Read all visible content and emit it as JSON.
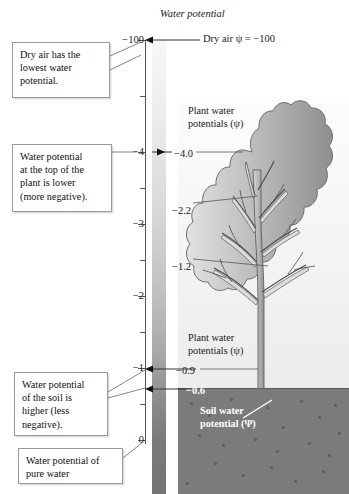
{
  "figure": {
    "title": "Water potential",
    "dry_air_label": "Dry air ψ = −100"
  },
  "axis": {
    "major_ticks": [
      {
        "label": "−100",
        "y": 40
      },
      {
        "label": "−4",
        "y": 152
      },
      {
        "label": "−3",
        "y": 224
      },
      {
        "label": "−2",
        "y": 296
      },
      {
        "label": "−1",
        "y": 368
      },
      {
        "label": "0",
        "y": 440
      }
    ],
    "minor_ticks_y": [
      96,
      188,
      260,
      332,
      404
    ]
  },
  "callouts": [
    {
      "name": "dry-air-callout",
      "lines": [
        "Dry air has the",
        "lowest water",
        "potential."
      ],
      "x": 12,
      "y": 42,
      "w": 98,
      "h": 56
    },
    {
      "name": "plant-top-callout",
      "lines": [
        "Water potential",
        "at the top of the",
        "plant is lower",
        "(more negative)."
      ],
      "x": 12,
      "y": 144,
      "w": 100,
      "h": 68
    },
    {
      "name": "soil-callout",
      "lines": [
        "Water potential",
        "of the soil is",
        "higher (less",
        "negative)."
      ],
      "x": 14,
      "y": 372,
      "w": 94,
      "h": 64
    },
    {
      "name": "pure-water-callout",
      "lines": [
        "Water potential of",
        "pure water"
      ],
      "x": 18,
      "y": 448,
      "w": 105,
      "h": 36
    }
  ],
  "panel_labels": [
    {
      "name": "plant-water-potentials-top",
      "lines": [
        "Plant water",
        "potentials (ψ)"
      ],
      "x": 188,
      "y": 104
    },
    {
      "name": "plant-water-potentials-bottom",
      "lines": [
        "Plant water",
        "potentials (ψ)"
      ],
      "x": 188,
      "y": 331
    },
    {
      "name": "soil-water-potential",
      "lines": [
        "Soil water",
        "potential (Ψ)"
      ],
      "x": 200,
      "y": 404,
      "white": true
    }
  ],
  "value_labels": [
    {
      "name": "value-minus-4",
      "text": "−4.0",
      "x": 174,
      "y": 148,
      "white": false
    },
    {
      "name": "value-minus-2-2",
      "text": "−2.2",
      "x": 172,
      "y": 205,
      "white": false
    },
    {
      "name": "value-minus-1-2",
      "text": "−1.2",
      "x": 172,
      "y": 261,
      "white": false
    },
    {
      "name": "value-minus-0-9",
      "text": "−0.9",
      "x": 176,
      "y": 365,
      "white": false
    },
    {
      "name": "value-minus-0-6",
      "text": "−0.6",
      "x": 186,
      "y": 385,
      "white": true
    }
  ],
  "colors": {
    "soil": "#7b7b7b",
    "panel_light": "#fdfdfd",
    "axis": "#555555",
    "plant_fill_light": "#d8d8d8",
    "plant_fill_dark": "#8e8e8e"
  }
}
